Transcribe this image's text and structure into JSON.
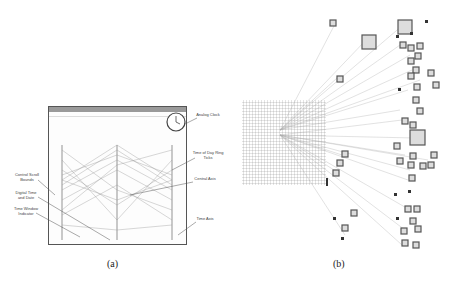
{
  "figure": {
    "panel_a": {
      "caption": "(a)",
      "window": {
        "title": "",
        "menu": [
          "File",
          "Edit",
          "Help"
        ],
        "button": "Browse..."
      },
      "annotations": [
        {
          "id": "analog-clock",
          "text": "Analog Clock"
        },
        {
          "id": "time-ring",
          "text": "Time of Day Ring Ticks"
        },
        {
          "id": "central-axis",
          "text": "Central Axis"
        },
        {
          "id": "time-axis",
          "text": "Time Axis"
        },
        {
          "id": "control-scroll",
          "text": "Control Scroll Bounds"
        },
        {
          "id": "digital-time",
          "text": "Digital Time and Date"
        },
        {
          "id": "time-window",
          "text": "Time Window Indicator"
        }
      ]
    },
    "panel_b": {
      "caption": "(b)"
    }
  },
  "colors": {
    "lines": "#888888",
    "squares": "#555555",
    "fill": "#d8d8d8"
  }
}
